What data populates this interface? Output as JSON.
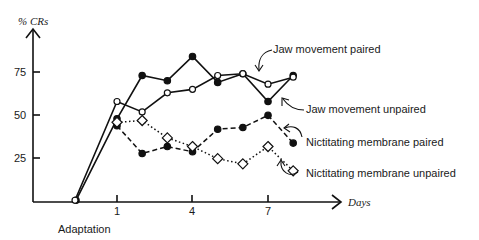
{
  "chart_data": {
    "type": "line",
    "title": "",
    "ylabel": "% CRs",
    "xlabel": "Days",
    "x_extra_label": "Adaptation",
    "x": [
      "Adaptation",
      1,
      2,
      3,
      4,
      5,
      6,
      7,
      8
    ],
    "xticks": [
      1,
      4,
      7
    ],
    "yticks": [
      25,
      50,
      75
    ],
    "ylim": [
      0,
      100
    ],
    "grid": false,
    "legend_position": "inline-right (arrow annotations)",
    "series": [
      {
        "name": "Jaw movement paired",
        "marker": "filled-circle",
        "line": "solid",
        "values": [
          1,
          48,
          73,
          70,
          84,
          69,
          74,
          58,
          73
        ]
      },
      {
        "name": "Jaw movement unpaired",
        "marker": "open-circle",
        "line": "solid",
        "values": [
          1,
          58,
          52,
          63,
          65,
          73,
          74,
          68,
          72
        ]
      },
      {
        "name": "Nictitating membrane paired",
        "marker": "filled-circle",
        "line": "dashed",
        "values": [
          null,
          44,
          28,
          32,
          29,
          42,
          43,
          50,
          34
        ]
      },
      {
        "name": "Nictitating membrane unpaired",
        "marker": "open-diamond",
        "line": "dotted",
        "values": [
          null,
          46,
          47,
          37,
          32,
          25,
          22,
          32,
          18
        ]
      }
    ]
  },
  "labels": {
    "ylabel": "% CRs",
    "xlabel": "Days",
    "adaptation": "Adaptation",
    "y25": "25",
    "y50": "50",
    "y75": "75",
    "x1": "1",
    "x4": "4",
    "x7": "7",
    "jm_paired": "Jaw movement paired",
    "jm_unpaired": "Jaw movement unpaired",
    "nm_paired": "Nictitating membrane paired",
    "nm_unpaired": "Nictitating membrane unpaired"
  }
}
